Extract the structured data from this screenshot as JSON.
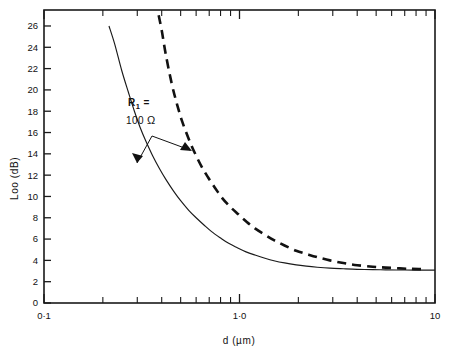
{
  "chart_data": {
    "type": "line",
    "title": "",
    "xlabel": "d  (µm)",
    "ylabel": "Loo  (dB)",
    "xscale": "log",
    "yscale": "linear",
    "xlim": [
      0.1,
      10
    ],
    "ylim": [
      0,
      27.5
    ],
    "grid": false,
    "legend_position": "none",
    "xticklabels": [
      "0·1",
      "1·0",
      "10"
    ],
    "xtickvalues": [
      0.1,
      1.0,
      10
    ],
    "yticklabels": [
      "0",
      "2",
      "4",
      "6",
      "8",
      "10",
      "12",
      "14",
      "16",
      "18",
      "20",
      "22",
      "24",
      "26"
    ],
    "ytickvalues": [
      0,
      2,
      4,
      6,
      8,
      10,
      12,
      14,
      16,
      18,
      20,
      22,
      24,
      26
    ],
    "annotations": [
      {
        "name": "r1-label",
        "line1": "R",
        "subscript": "1",
        "line1_suffix": " =",
        "line2": "100  Ω"
      }
    ],
    "series": [
      {
        "name": "solid-curve",
        "style": "solid",
        "x": [
          0.215,
          0.23,
          0.25,
          0.27,
          0.29,
          0.31,
          0.33,
          0.36,
          0.39,
          0.42,
          0.46,
          0.5,
          0.55,
          0.6,
          0.66,
          0.72,
          0.8,
          0.88,
          0.97,
          1.08,
          1.2,
          1.35,
          1.5,
          1.7,
          1.95,
          2.2,
          2.5,
          2.9,
          3.4,
          4.0,
          4.8,
          5.6,
          6.6,
          7.8,
          9.0,
          10.0
        ],
        "y": [
          26.0,
          24.3,
          21.8,
          19.8,
          18.0,
          16.5,
          15.3,
          13.8,
          12.6,
          11.6,
          10.5,
          9.6,
          8.7,
          8.0,
          7.3,
          6.7,
          6.1,
          5.6,
          5.2,
          4.8,
          4.5,
          4.2,
          3.97,
          3.76,
          3.58,
          3.46,
          3.36,
          3.27,
          3.21,
          3.16,
          3.13,
          3.11,
          3.1,
          3.09,
          3.08,
          3.08
        ]
      },
      {
        "name": "dashed-curve",
        "style": "dashed",
        "x": [
          0.386,
          0.4,
          0.42,
          0.45,
          0.48,
          0.51,
          0.55,
          0.59,
          0.64,
          0.69,
          0.75,
          0.82,
          0.9,
          0.99,
          1.09,
          1.2,
          1.35,
          1.5,
          1.7,
          1.95,
          2.2,
          2.5,
          2.9,
          3.4,
          4.0,
          4.8,
          5.6,
          6.6,
          7.6,
          8.5
        ],
        "y": [
          27.0,
          25.6,
          23.3,
          20.6,
          18.6,
          17.0,
          15.4,
          14.1,
          12.8,
          11.8,
          10.8,
          9.8,
          9.0,
          8.3,
          7.6,
          7.0,
          6.4,
          5.9,
          5.4,
          4.9,
          4.6,
          4.3,
          4.0,
          3.75,
          3.55,
          3.4,
          3.32,
          3.25,
          3.2,
          3.18
        ]
      }
    ]
  },
  "axes": {
    "y_title": "Loo  (dB)",
    "x_title": "d  (µm)"
  },
  "annotation": {
    "r_symbol": "R",
    "r_sub": "1",
    "r_eq": "=",
    "r_value": "100",
    "r_unit": "Ω"
  }
}
